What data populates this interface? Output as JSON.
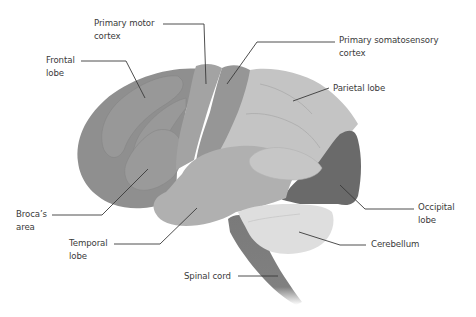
{
  "diagram": {
    "colors": {
      "frontal": "#8f8f8f",
      "frontal_gyrus": "#989898",
      "motor": "#a3a3a3",
      "somatosensory": "#969696",
      "parietal": "#c4c4c4",
      "temporal": "#b0b0b0",
      "occipital": "#6a6a6a",
      "cerebellum": "#dedede",
      "brainstem": "#7a7a7a",
      "leader_line": "#3a3a3a",
      "text": "#3a3a3a"
    },
    "labels": [
      {
        "id": "primary-motor-cortex",
        "lines": [
          "Primary motor",
          "cortex"
        ]
      },
      {
        "id": "frontal-lobe",
        "lines": [
          "Frontal",
          "lobe"
        ]
      },
      {
        "id": "primary-somatosensory-cortex",
        "lines": [
          "Primary somatosensory",
          "cortex"
        ]
      },
      {
        "id": "parietal-lobe",
        "lines": [
          "Parietal lobe"
        ]
      },
      {
        "id": "brocas-area",
        "lines": [
          "Broca’s",
          "area"
        ]
      },
      {
        "id": "temporal-lobe",
        "lines": [
          "Temporal",
          "lobe"
        ]
      },
      {
        "id": "occipital-lobe",
        "lines": [
          "Occipital",
          "lobe"
        ]
      },
      {
        "id": "cerebellum",
        "lines": [
          "Cerebellum"
        ]
      },
      {
        "id": "spinal-cord",
        "lines": [
          "Spinal cord"
        ]
      }
    ]
  }
}
